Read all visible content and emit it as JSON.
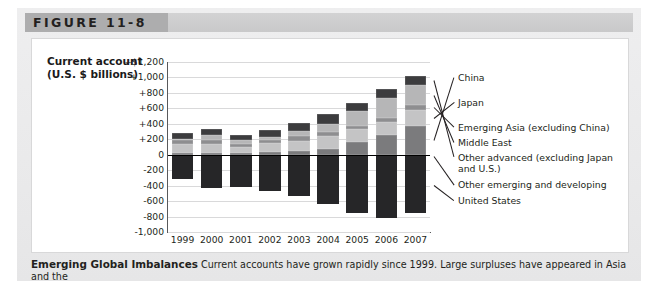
{
  "figure": {
    "label": "FIGURE 11-8",
    "axis_title_line1": "Current account",
    "axis_title_line2": "(U.S. $ billions)",
    "caption_title": "Emerging Global Imbalances",
    "caption_body": "Current accounts have grown rapidly since 1999. Large surpluses have appeared in Asia and the"
  },
  "chart_data": {
    "type": "bar",
    "subtype": "stacked-bar-diverging",
    "title": "",
    "xlabel": "",
    "ylabel": "Current account (U.S. $ billions)",
    "categories": [
      "1999",
      "2000",
      "2001",
      "2002",
      "2003",
      "2004",
      "2005",
      "2006",
      "2007"
    ],
    "ylim": [
      -1000,
      1200
    ],
    "ytick_labels": [
      "+$1,200",
      "+1,000",
      "+800",
      "+600",
      "+400",
      "+200",
      "0",
      "-200",
      "-400",
      "-600",
      "-800",
      "-1,000"
    ],
    "ytick_values": [
      1200,
      1000,
      800,
      600,
      400,
      200,
      0,
      -200,
      -400,
      -600,
      -800,
      -1000
    ],
    "grid": true,
    "legend_position": "right-leader-lines",
    "series": [
      {
        "name": "China",
        "color": "#7b7b7d",
        "values": [
          20,
          20,
          17,
          35,
          46,
          69,
          161,
          250,
          372
        ]
      },
      {
        "name": "Japan",
        "color": "#c4c4c5",
        "values": [
          115,
          120,
          88,
          112,
          136,
          172,
          166,
          170,
          211
        ]
      },
      {
        "name": "Emerging Asia (excluding China)",
        "color": "#8e8e90",
        "values": [
          55,
          47,
          40,
          47,
          66,
          56,
          40,
          52,
          62
        ]
      },
      {
        "name": "Middle East",
        "color": "#b6b6b7",
        "values": [
          13,
          72,
          40,
          30,
          59,
          103,
          196,
          264,
          262
        ]
      },
      {
        "name": "Other advanced (excluding Japan and U.S.)",
        "color": "#3c3c3e",
        "values": [
          78,
          78,
          72,
          92,
          103,
          123,
          111,
          119,
          113
        ]
      },
      {
        "name": "Other emerging and developing",
        "color": "#2b2b2d",
        "values": [
          -16,
          -9,
          -18,
          -10,
          -8,
          -6,
          -10,
          -12,
          -22
        ]
      },
      {
        "name": "United States",
        "color": "#262628",
        "values": [
          -300,
          -416,
          -397,
          -459,
          -521,
          -631,
          -748,
          -804,
          -731
        ]
      }
    ]
  },
  "legend": {
    "items": [
      {
        "label": "China",
        "swatch": "#7b7b7d"
      },
      {
        "label": "Japan",
        "swatch": "#c4c4c5"
      },
      {
        "label": "Emerging Asia (excluding China)",
        "swatch": "#8e8e90"
      },
      {
        "label": "Middle East",
        "swatch": "#b6b6b7"
      },
      {
        "label": "Other advanced (excluding Japan and U.S.)",
        "swatch": "#3c3c3e"
      },
      {
        "label": "Other emerging and developing",
        "swatch": "#2b2b2d"
      },
      {
        "label": "United States",
        "swatch": "#262628"
      }
    ]
  }
}
